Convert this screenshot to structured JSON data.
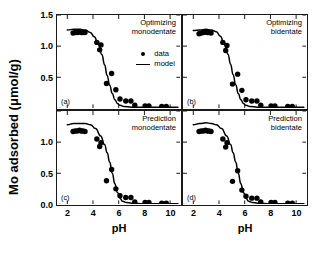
{
  "chart_data": {
    "type": "scatter",
    "title": "",
    "xlabel": "pH",
    "ylabel": "Mo adsorbed (μmol/g)",
    "xlim": [
      1.2,
      10.8
    ],
    "ylim_top": [
      0.0,
      1.5
    ],
    "ylim_bottom": [
      0.0,
      1.5
    ],
    "xticks": [
      2,
      4,
      6,
      8,
      10
    ],
    "yticks_top": [
      0.5,
      1.0,
      1.5
    ],
    "yticks_bottom": [
      0.0,
      0.5,
      1.0
    ],
    "grid": false,
    "legend": {
      "position": "panel-a-upper-right",
      "entries": [
        {
          "label": "data",
          "marker": "filled-circle",
          "color": "#000000"
        },
        {
          "label": "model",
          "marker": "line",
          "color": "#000000"
        }
      ]
    },
    "panels": [
      {
        "tag": "(a)",
        "title_line1": "Optimizing",
        "title_line2": "monodentate",
        "data": {
          "x": [
            2.45,
            2.62,
            2.78,
            2.95,
            3.08,
            3.22,
            3.38,
            4.3,
            4.52,
            4.62,
            5.05,
            5.45,
            5.78,
            6.1,
            6.55,
            6.95,
            7.25,
            8.05,
            8.35,
            9.35,
            9.7
          ],
          "y": [
            1.21,
            1.22,
            1.22,
            1.23,
            1.22,
            1.22,
            1.22,
            1.06,
            0.94,
            1.02,
            0.4,
            0.56,
            0.3,
            0.15,
            0.12,
            0.12,
            0.05,
            0.04,
            0.04,
            0.03,
            0.03
          ]
        },
        "model": {
          "x": [
            2.0,
            2.5,
            3.0,
            3.4,
            3.8,
            4.1,
            4.4,
            4.7,
            4.9,
            5.1,
            5.3,
            5.5,
            5.7,
            5.9,
            6.1,
            6.4,
            7.0,
            8.0,
            9.0,
            10.0,
            10.6
          ],
          "y": [
            1.26,
            1.27,
            1.27,
            1.26,
            1.22,
            1.15,
            1.04,
            0.86,
            0.7,
            0.53,
            0.37,
            0.24,
            0.14,
            0.08,
            0.05,
            0.03,
            0.02,
            0.02,
            0.02,
            0.02,
            0.02
          ]
        }
      },
      {
        "tag": "(b)",
        "title_line1": "Optimizing",
        "title_line2": "bidentate",
        "data": {
          "x": [
            2.45,
            2.62,
            2.78,
            2.95,
            3.08,
            3.22,
            3.38,
            4.3,
            4.52,
            4.62,
            5.05,
            5.45,
            5.78,
            6.1,
            6.55,
            6.95,
            7.25,
            8.05,
            8.35,
            9.35,
            9.7
          ],
          "y": [
            1.2,
            1.21,
            1.22,
            1.23,
            1.22,
            1.22,
            1.21,
            1.06,
            0.93,
            1.01,
            0.39,
            0.55,
            0.29,
            0.14,
            0.12,
            0.12,
            0.05,
            0.04,
            0.04,
            0.03,
            0.03
          ]
        },
        "model": {
          "x": [
            2.0,
            2.5,
            3.0,
            3.4,
            3.8,
            4.1,
            4.4,
            4.7,
            4.9,
            5.1,
            5.3,
            5.5,
            5.7,
            5.9,
            6.1,
            6.4,
            7.0,
            8.0,
            9.0,
            10.0,
            10.6
          ],
          "y": [
            1.25,
            1.26,
            1.27,
            1.26,
            1.23,
            1.16,
            1.05,
            0.87,
            0.71,
            0.54,
            0.38,
            0.24,
            0.14,
            0.08,
            0.05,
            0.03,
            0.02,
            0.02,
            0.02,
            0.02,
            0.02
          ]
        }
      },
      {
        "tag": "(c)",
        "title_line1": "Prediction",
        "title_line2": "monodentate",
        "data": {
          "x": [
            2.45,
            2.62,
            2.78,
            2.95,
            3.08,
            3.22,
            3.38,
            4.3,
            4.52,
            4.62,
            5.05,
            5.45,
            5.78,
            6.1,
            6.55,
            6.95,
            7.25,
            8.05,
            8.35,
            9.35,
            9.7
          ],
          "y": [
            1.17,
            1.18,
            1.18,
            1.19,
            1.18,
            1.18,
            1.17,
            1.05,
            0.93,
            0.99,
            0.38,
            0.56,
            0.25,
            0.14,
            0.11,
            0.11,
            0.04,
            0.03,
            0.03,
            0.02,
            0.02
          ]
        },
        "model": {
          "x": [
            2.0,
            2.5,
            3.0,
            3.4,
            3.8,
            4.2,
            4.6,
            4.9,
            5.1,
            5.3,
            5.5,
            5.7,
            5.9,
            6.1,
            6.3,
            6.6,
            7.0,
            8.0,
            9.0,
            10.0,
            10.6
          ],
          "y": [
            1.28,
            1.3,
            1.3,
            1.3,
            1.28,
            1.22,
            1.1,
            0.96,
            0.83,
            0.68,
            0.5,
            0.33,
            0.19,
            0.1,
            0.05,
            0.03,
            0.02,
            0.01,
            0.01,
            0.01,
            0.01
          ]
        }
      },
      {
        "tag": "(d)",
        "title_line1": "Prediction",
        "title_line2": "bidentate",
        "data": {
          "x": [
            2.45,
            2.62,
            2.78,
            2.95,
            3.08,
            3.22,
            3.38,
            4.3,
            4.52,
            4.62,
            5.05,
            5.45,
            5.78,
            6.1,
            6.55,
            6.95,
            7.25,
            8.05,
            8.35,
            9.35,
            9.7
          ],
          "y": [
            1.17,
            1.18,
            1.18,
            1.19,
            1.18,
            1.18,
            1.17,
            1.05,
            0.92,
            0.99,
            0.37,
            0.54,
            0.23,
            0.13,
            0.1,
            0.1,
            0.04,
            0.03,
            0.03,
            0.02,
            0.02
          ]
        },
        "model": {
          "x": [
            2.0,
            2.5,
            3.0,
            3.4,
            3.8,
            4.2,
            4.6,
            4.9,
            5.1,
            5.3,
            5.5,
            5.7,
            5.9,
            6.1,
            6.3,
            6.6,
            7.0,
            8.0,
            9.0,
            10.0,
            10.6
          ],
          "y": [
            1.28,
            1.3,
            1.31,
            1.3,
            1.28,
            1.22,
            1.1,
            0.96,
            0.83,
            0.68,
            0.5,
            0.33,
            0.19,
            0.1,
            0.05,
            0.03,
            0.02,
            0.01,
            0.01,
            0.01,
            0.01
          ]
        }
      }
    ]
  }
}
